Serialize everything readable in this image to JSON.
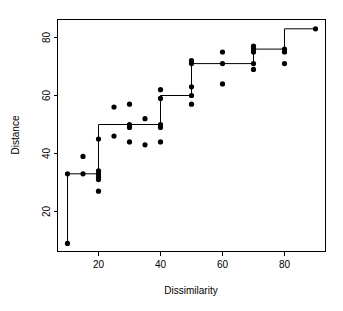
{
  "chart_data": {
    "type": "scatter",
    "title": "",
    "xlabel": "Dissimilarity",
    "ylabel": "Distance",
    "xlim": [
      6,
      94
    ],
    "ylim": [
      5,
      86
    ],
    "xticks": [
      20,
      40,
      60,
      80
    ],
    "yticks": [
      20,
      40,
      60,
      80
    ],
    "grid": false,
    "legend": null,
    "point_color": "#000000",
    "line_color": "#000000",
    "series": [
      {
        "name": "observations",
        "type": "scatter",
        "x": [
          10,
          10,
          15,
          15,
          20,
          20,
          20,
          20,
          20,
          20,
          25,
          25,
          30,
          30,
          30,
          30,
          35,
          35,
          40,
          40,
          40,
          40,
          40,
          50,
          50,
          50,
          50,
          50,
          60,
          60,
          60,
          70,
          70,
          70,
          70,
          70,
          80,
          80,
          80,
          90
        ],
        "y": [
          33,
          9,
          39,
          33,
          34,
          33,
          32,
          31,
          27,
          45,
          56,
          46,
          57,
          50,
          49,
          44,
          52,
          43,
          62,
          59,
          50,
          49,
          44,
          72,
          71,
          63,
          60,
          57,
          75,
          71,
          64,
          77,
          76,
          75,
          71,
          69,
          76,
          75,
          71,
          83
        ]
      },
      {
        "name": "isotonic-step-fit",
        "type": "step",
        "x": [
          10,
          10,
          20,
          20,
          40,
          40,
          50,
          50,
          70,
          70,
          80,
          80,
          90
        ],
        "y": [
          9,
          33,
          33,
          50,
          50,
          60,
          60,
          71,
          71,
          76,
          76,
          83,
          83
        ]
      }
    ]
  },
  "axes": {
    "x_label": "Dissimilarity",
    "y_label": "Distance",
    "x_tick_labels": [
      "20",
      "40",
      "60",
      "80"
    ],
    "y_tick_labels": [
      "20",
      "40",
      "60",
      "80"
    ]
  }
}
